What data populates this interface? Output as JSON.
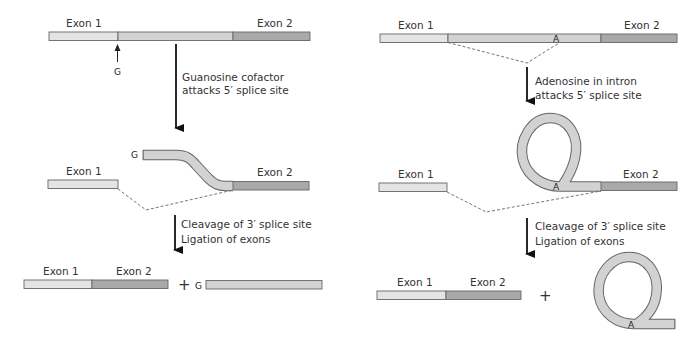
{
  "colors": {
    "exon1": "#e4e4e4",
    "intron": "#d2d2d2",
    "exon2": "#a9a9a9",
    "outline": "#666666",
    "arrow": "#111111"
  },
  "left_panel": {
    "name": "Group I self-splicing (guanosine cofactor)",
    "step1": {
      "exon1_label": "Exon 1",
      "exon2_label": "Exon 2",
      "cofactor_label": "G"
    },
    "arrow1_caption": [
      "Guanosine cofactor",
      "attacks 5′ splice site"
    ],
    "step2": {
      "g_label": "G",
      "exon1_label": "Exon 1",
      "exon2_label": "Exon 2"
    },
    "arrow2_caption": [
      "Cleavage of 3′ splice site",
      "Ligation of exons"
    ],
    "step3": {
      "exon1_label": "Exon 1",
      "exon2_label": "Exon 2",
      "plus": "+",
      "g_label": "G"
    }
  },
  "right_panel": {
    "name": "Lariat splicing (adenosine in intron)",
    "step1": {
      "exon1_label": "Exon 1",
      "exon2_label": "Exon 2",
      "branch_label": "A"
    },
    "arrow1_caption": [
      "Adenosine in intron",
      "attacks 5′ splice site"
    ],
    "step2": {
      "exon1_label": "Exon 1",
      "exon2_label": "Exon 2",
      "branch_label": "A"
    },
    "arrow2_caption": [
      "Cleavage of 3′ splice site",
      "Ligation of exons"
    ],
    "step3": {
      "exon1_label": "Exon 1",
      "exon2_label": "Exon 2",
      "plus": "+",
      "branch_label": "A"
    }
  }
}
